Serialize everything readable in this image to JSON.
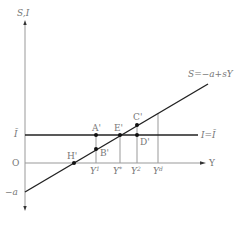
{
  "diagram": {
    "type": "keynesian-saving-investment",
    "axes": {
      "y_label": "S,I",
      "x_label": "Y",
      "origin_label": "O",
      "intercept_label": "−a",
      "ibar_label": "Ī"
    },
    "lines": {
      "saving": {
        "label": "S=−a+sY",
        "color": "#222222"
      },
      "investment": {
        "label": "I=Ī",
        "color": "#222222"
      }
    },
    "points": {
      "A": "A'",
      "B": "B'",
      "C": "C'",
      "D": "D'",
      "E": "E'",
      "H": "H'"
    },
    "x_ticks": {
      "y1": {
        "base": "Y",
        "sup": "1"
      },
      "ystar": {
        "base": "Y",
        "sup": "*"
      },
      "y2": {
        "base": "Y",
        "sup": "2"
      },
      "yd": {
        "base": "Y",
        "sup": "d"
      }
    },
    "colors": {
      "axis": "#888888",
      "line": "#222222",
      "guide": "#999999",
      "text": "#777777"
    }
  }
}
